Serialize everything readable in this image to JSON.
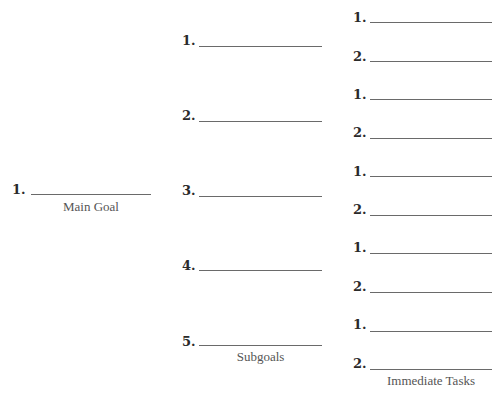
{
  "main_goal": {
    "caption": "Main Goal",
    "items": [
      {
        "number": "1.",
        "value": ""
      }
    ]
  },
  "subgoals": {
    "caption": "Subgoals",
    "items": [
      {
        "number": "1.",
        "value": ""
      },
      {
        "number": "2.",
        "value": ""
      },
      {
        "number": "3.",
        "value": ""
      },
      {
        "number": "4.",
        "value": ""
      },
      {
        "number": "5.",
        "value": ""
      }
    ]
  },
  "immediate_tasks": {
    "caption": "Immediate Tasks",
    "groups": [
      {
        "items": [
          {
            "number": "1.",
            "value": ""
          },
          {
            "number": "2.",
            "value": ""
          }
        ]
      },
      {
        "items": [
          {
            "number": "1.",
            "value": ""
          },
          {
            "number": "2.",
            "value": ""
          }
        ]
      },
      {
        "items": [
          {
            "number": "1.",
            "value": ""
          },
          {
            "number": "2.",
            "value": ""
          }
        ]
      },
      {
        "items": [
          {
            "number": "1.",
            "value": ""
          },
          {
            "number": "2.",
            "value": ""
          }
        ]
      },
      {
        "items": [
          {
            "number": "1.",
            "value": ""
          },
          {
            "number": "2.",
            "value": ""
          }
        ]
      }
    ]
  }
}
